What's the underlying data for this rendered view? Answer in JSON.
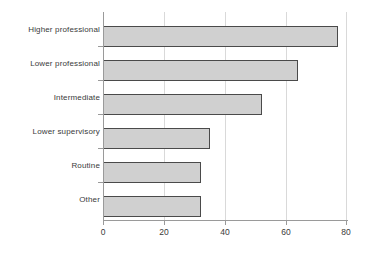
{
  "chart_data": {
    "type": "bar",
    "orientation": "horizontal",
    "title": "",
    "xlabel": "",
    "ylabel": "",
    "categories": [
      "Higher professional",
      "Lower professional",
      "Intermediate",
      "Lower supervisory",
      "Routine",
      "Other"
    ],
    "values": [
      77,
      64,
      52,
      35,
      32,
      32
    ],
    "xlim": [
      0,
      80
    ],
    "xticks": [
      0,
      20,
      40,
      60,
      80
    ],
    "xtick_labels": [
      "0",
      "20",
      "40",
      "60",
      "80"
    ],
    "grid": "vertical",
    "legend": "none",
    "bar_fill_color": "#d0d0d0",
    "bar_border_color": "#4a4a4a",
    "gridline_color": "#d9d9d9",
    "axis_color": "#9a9a9a",
    "text_color": "#3a3a3a",
    "background_color": "#ffffff"
  }
}
